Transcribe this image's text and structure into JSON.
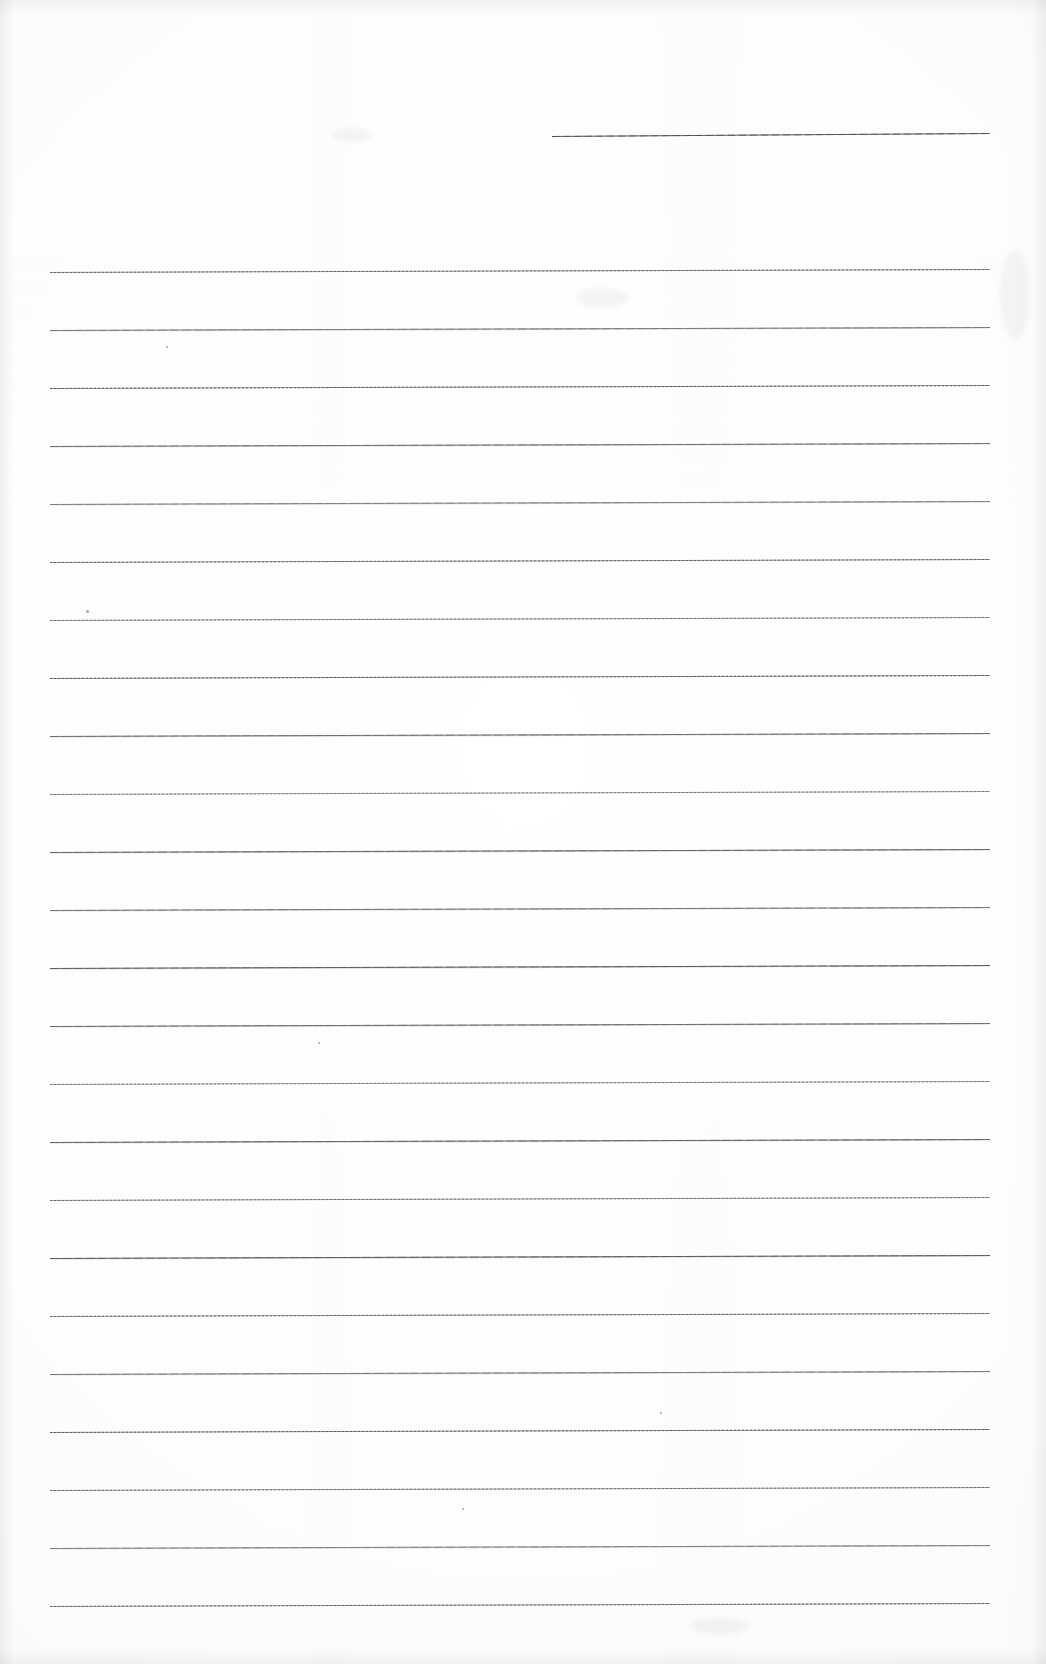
{
  "document": {
    "kind": "scanned-ruled-notepaper",
    "title": "Blank Ruled Paper Scan",
    "page_width": 1046,
    "page_height": 1664,
    "background_color": "#fefefe",
    "ink_color": "#6f7276",
    "visible_text": "",
    "note": "The scanned sheet is blank: no handwriting, headings, numbers or labels are present."
  },
  "header_rule": {
    "name": "top-right-short-rule",
    "x_start": 552,
    "x_end": 990,
    "y": 136,
    "tilt_px": -3,
    "style": "solid",
    "color": "#6d7075"
  },
  "ruled_area": {
    "x_start": 50,
    "x_end": 990,
    "first_line_y": 272,
    "line_spacing": 58.2,
    "line_count": 24,
    "tilt_px": -3,
    "colors": {
      "solid": "#6f7276",
      "dotted": "#8a8d92"
    },
    "lines": [
      {
        "index": 1,
        "y": 272,
        "style": "dotted"
      },
      {
        "index": 2,
        "y": 330,
        "style": "solid"
      },
      {
        "index": 3,
        "y": 388,
        "style": "dotted"
      },
      {
        "index": 4,
        "y": 446,
        "style": "solid"
      },
      {
        "index": 5,
        "y": 504,
        "style": "solid"
      },
      {
        "index": 6,
        "y": 562,
        "style": "dotted"
      },
      {
        "index": 7,
        "y": 620,
        "style": "dotted"
      },
      {
        "index": 8,
        "y": 678,
        "style": "dotted"
      },
      {
        "index": 9,
        "y": 736,
        "style": "solid"
      },
      {
        "index": 10,
        "y": 794,
        "style": "dotted"
      },
      {
        "index": 11,
        "y": 852,
        "style": "solid"
      },
      {
        "index": 12,
        "y": 910,
        "style": "solid"
      },
      {
        "index": 13,
        "y": 968,
        "style": "solid"
      },
      {
        "index": 14,
        "y": 1026,
        "style": "solid"
      },
      {
        "index": 15,
        "y": 1084,
        "style": "dotted"
      },
      {
        "index": 16,
        "y": 1142,
        "style": "solid"
      },
      {
        "index": 17,
        "y": 1200,
        "style": "dotted"
      },
      {
        "index": 18,
        "y": 1258,
        "style": "solid"
      },
      {
        "index": 19,
        "y": 1316,
        "style": "dotted"
      },
      {
        "index": 20,
        "y": 1374,
        "style": "solid"
      },
      {
        "index": 21,
        "y": 1432,
        "style": "dotted"
      },
      {
        "index": 22,
        "y": 1490,
        "style": "dotted"
      },
      {
        "index": 23,
        "y": 1548,
        "style": "solid"
      },
      {
        "index": 24,
        "y": 1606,
        "style": "dotted"
      }
    ]
  },
  "artifacts": {
    "specks": [
      {
        "x": 86,
        "y": 610,
        "size": 3
      },
      {
        "x": 166,
        "y": 346,
        "size": 2
      },
      {
        "x": 318,
        "y": 1042,
        "size": 2
      },
      {
        "x": 660,
        "y": 1412,
        "size": 2
      },
      {
        "x": 462,
        "y": 1508,
        "size": 2
      }
    ],
    "smudges": [
      {
        "x": 332,
        "y": 128,
        "w": 40,
        "h": 14
      },
      {
        "x": 576,
        "y": 288,
        "w": 52,
        "h": 20
      },
      {
        "x": 1000,
        "y": 250,
        "w": 30,
        "h": 90
      },
      {
        "x": 690,
        "y": 1618,
        "w": 60,
        "h": 16
      }
    ]
  }
}
